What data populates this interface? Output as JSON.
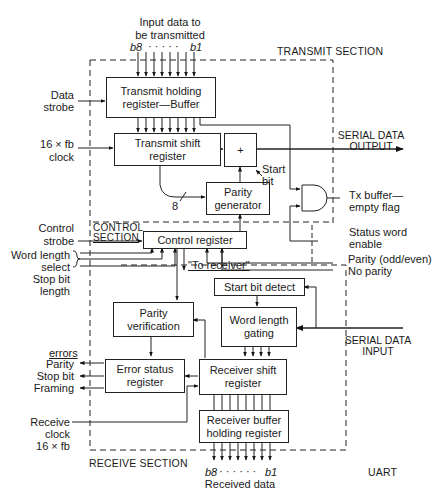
{
  "input_data": {
    "title_line1": "Input data to",
    "title_line2": "be transmitted",
    "msb": "b8",
    "lsb": "b1",
    "dots": "· · · · ·"
  },
  "sections": {
    "transmit": "TRANSMIT SECTION",
    "control_line1": "CONTROL",
    "control_line2": "SECTION",
    "receive": "RECEIVE SECTION",
    "uart": "UART"
  },
  "blocks": {
    "transmit_holding": "Transmit holding register—Buffer",
    "transmit_shift": "Transmit shift register",
    "adder": "+",
    "parity_generator": "Parity generator",
    "control_register": "Control register",
    "start_bit_detect": "Start bit detect",
    "word_length_gating": "Word length gating",
    "parity_verification": "Parity verification",
    "error_status": "Error status register",
    "receiver_shift": "Receiver shift register",
    "receiver_buffer": "Receiver buffer holding register"
  },
  "signals": {
    "data_strobe_1": "Data",
    "data_strobe_2": "strobe",
    "clock_tx_1": "16 × fb",
    "clock_tx_2": "clock",
    "bus_width": "8",
    "start_bit_1": "Start",
    "start_bit_2": "bit",
    "serial_out_1": "SERIAL DATA",
    "serial_out_2": "OUTPUT",
    "tx_flag_1": "Tx buffer—",
    "tx_flag_2": "empty flag",
    "status_enable_1": "Status word",
    "status_enable_2": "enable",
    "parity_oe": "Parity (odd/even)",
    "no_parity": "No parity",
    "control_strobe_1": "Control",
    "control_strobe_2": "strobe",
    "word_length_1": "Word length",
    "word_length_2": "select",
    "stop_bit_1": "Stop bit",
    "stop_bit_2": "length",
    "to_receiver": "\"To receiver\"",
    "serial_in_1": "SERIAL DATA",
    "serial_in_2": "INPUT",
    "errors_title": "errors",
    "err_parity": "Parity",
    "err_stop": "Stop bit",
    "err_framing": "Framing",
    "rx_clock_1": "Receive",
    "rx_clock_2": "clock",
    "rx_clock_3": "16 × fb"
  },
  "output_data": {
    "msb": "b8",
    "lsb": "b1",
    "dots": "· · · · · ·",
    "title": "Received data"
  }
}
